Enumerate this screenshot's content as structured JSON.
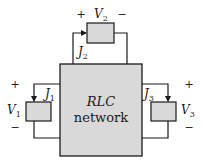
{
  "diagram": {
    "type": "circuit",
    "colors": {
      "stroke": "#1a1a1a",
      "box_fill": "#d9d9d9",
      "background": "#ffffff"
    },
    "network": {
      "line1": "RLC",
      "line2": "network"
    },
    "ports": [
      {
        "id": "port1",
        "voltage_label": "V",
        "voltage_sub": "1",
        "current_label": "J",
        "current_sub": "1",
        "plus": "+",
        "minus": "−"
      },
      {
        "id": "port2",
        "voltage_label": "V",
        "voltage_sub": "2",
        "current_label": "J",
        "current_sub": "2",
        "plus": "+",
        "minus": "−"
      },
      {
        "id": "port3",
        "voltage_label": "V",
        "voltage_sub": "3",
        "current_label": "J",
        "current_sub": "3",
        "plus": "+",
        "minus": "−"
      }
    ]
  }
}
